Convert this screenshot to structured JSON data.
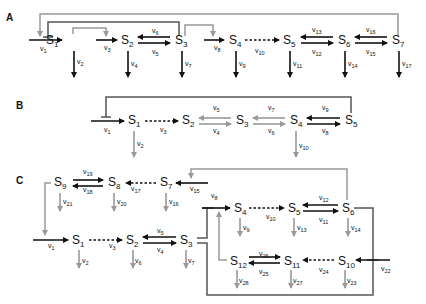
{
  "colors": {
    "black": "#111111",
    "gray": "#999999",
    "dark": "#555555"
  },
  "panels": [
    {
      "label": "A",
      "x": 6,
      "y": 21,
      "species": [
        {
          "name": "S",
          "sub": "1",
          "x": 46,
          "y": 44
        },
        {
          "name": "S",
          "sub": "2",
          "x": 121,
          "y": 44
        },
        {
          "name": "S",
          "sub": "3",
          "x": 175,
          "y": 44
        },
        {
          "name": "S",
          "sub": "4",
          "x": 229,
          "y": 44
        },
        {
          "name": "S",
          "sub": "5",
          "x": 283,
          "y": 44
        },
        {
          "name": "S",
          "sub": "6",
          "x": 338,
          "y": 44
        },
        {
          "name": "S",
          "sub": "7",
          "x": 392,
          "y": 44
        }
      ],
      "rates": [
        {
          "name": "v",
          "sub": "1",
          "x": 40,
          "y": 51
        },
        {
          "name": "v",
          "sub": "2",
          "x": 77,
          "y": 64
        },
        {
          "name": "v",
          "sub": "3",
          "x": 104,
          "y": 50
        },
        {
          "name": "v",
          "sub": "4",
          "x": 131,
          "y": 66
        },
        {
          "name": "v",
          "sub": "5",
          "x": 152,
          "y": 54
        },
        {
          "name": "v",
          "sub": "6",
          "x": 152,
          "y": 33
        },
        {
          "name": "v",
          "sub": "7",
          "x": 185,
          "y": 66
        },
        {
          "name": "v",
          "sub": "8",
          "x": 214,
          "y": 50
        },
        {
          "name": "v",
          "sub": "9",
          "x": 239,
          "y": 66
        },
        {
          "name": "v",
          "sub": "10",
          "x": 255,
          "y": 53
        },
        {
          "name": "v",
          "sub": "11",
          "x": 293,
          "y": 66
        },
        {
          "name": "v",
          "sub": "12",
          "x": 312,
          "y": 54
        },
        {
          "name": "v",
          "sub": "13",
          "x": 312,
          "y": 32
        },
        {
          "name": "v",
          "sub": "14",
          "x": 348,
          "y": 66
        },
        {
          "name": "v",
          "sub": "15",
          "x": 366,
          "y": 54
        },
        {
          "name": "v",
          "sub": "16",
          "x": 366,
          "y": 32
        },
        {
          "name": "v",
          "sub": "17",
          "x": 402,
          "y": 66
        }
      ]
    },
    {
      "label": "B",
      "x": 16,
      "y": 109,
      "species": [
        {
          "name": "S",
          "sub": "1",
          "x": 128,
          "y": 124
        },
        {
          "name": "S",
          "sub": "2",
          "x": 182,
          "y": 124
        },
        {
          "name": "S",
          "sub": "3",
          "x": 236,
          "y": 124
        },
        {
          "name": "S",
          "sub": "4",
          "x": 290,
          "y": 124
        },
        {
          "name": "S",
          "sub": "5",
          "x": 345,
          "y": 124
        }
      ],
      "rates": [
        {
          "name": "v",
          "sub": "1",
          "x": 104,
          "y": 132
        },
        {
          "name": "v",
          "sub": "2",
          "x": 137,
          "y": 146
        },
        {
          "name": "v",
          "sub": "3",
          "x": 160,
          "y": 132
        },
        {
          "name": "v",
          "sub": "4",
          "x": 213,
          "y": 133
        },
        {
          "name": "v",
          "sub": "5",
          "x": 213,
          "y": 110
        },
        {
          "name": "v",
          "sub": "6",
          "x": 268,
          "y": 133
        },
        {
          "name": "v",
          "sub": "7",
          "x": 268,
          "y": 110
        },
        {
          "name": "v",
          "sub": "8",
          "x": 322,
          "y": 133
        },
        {
          "name": "v",
          "sub": "9",
          "x": 322,
          "y": 110
        },
        {
          "name": "v",
          "sub": "10",
          "x": 299,
          "y": 148
        }
      ]
    },
    {
      "label": "C",
      "x": 16,
      "y": 184,
      "species": [
        {
          "name": "S",
          "sub": "9",
          "x": 54,
          "y": 186
        },
        {
          "name": "S",
          "sub": "8",
          "x": 108,
          "y": 186
        },
        {
          "name": "S",
          "sub": "7",
          "x": 160,
          "y": 186
        },
        {
          "name": "S",
          "sub": "1",
          "x": 72,
          "y": 244
        },
        {
          "name": "S",
          "sub": "2",
          "x": 126,
          "y": 244
        },
        {
          "name": "S",
          "sub": "3",
          "x": 180,
          "y": 244
        },
        {
          "name": "S",
          "sub": "4",
          "x": 234,
          "y": 212
        },
        {
          "name": "S",
          "sub": "5",
          "x": 288,
          "y": 212
        },
        {
          "name": "S",
          "sub": "6",
          "x": 342,
          "y": 212
        },
        {
          "name": "S",
          "sub": "12",
          "x": 230,
          "y": 265
        },
        {
          "name": "S",
          "sub": "11",
          "x": 284,
          "y": 265
        },
        {
          "name": "S",
          "sub": "10",
          "x": 338,
          "y": 265
        }
      ],
      "rates": [
        {
          "name": "v",
          "sub": "19",
          "x": 83,
          "y": 174
        },
        {
          "name": "v",
          "sub": "18",
          "x": 83,
          "y": 192
        },
        {
          "name": "v",
          "sub": "17",
          "x": 131,
          "y": 191
        },
        {
          "name": "v",
          "sub": "15",
          "x": 190,
          "y": 191
        },
        {
          "name": "v",
          "sub": "21",
          "x": 63,
          "y": 204
        },
        {
          "name": "v",
          "sub": "20",
          "x": 117,
          "y": 204
        },
        {
          "name": "v",
          "sub": "16",
          "x": 169,
          "y": 204
        },
        {
          "name": "v",
          "sub": "1",
          "x": 48,
          "y": 248
        },
        {
          "name": "v",
          "sub": "3",
          "x": 109,
          "y": 248
        },
        {
          "name": "v",
          "sub": "4",
          "x": 157,
          "y": 252
        },
        {
          "name": "v",
          "sub": "5",
          "x": 157,
          "y": 233
        },
        {
          "name": "v",
          "sub": "2",
          "x": 82,
          "y": 263
        },
        {
          "name": "v",
          "sub": "6",
          "x": 135,
          "y": 263
        },
        {
          "name": "v",
          "sub": "7",
          "x": 188,
          "y": 263
        },
        {
          "name": "v",
          "sub": "8",
          "x": 211,
          "y": 198
        },
        {
          "name": "v",
          "sub": "9",
          "x": 243,
          "y": 230
        },
        {
          "name": "v",
          "sub": "10",
          "x": 266,
          "y": 219
        },
        {
          "name": "v",
          "sub": "11",
          "x": 319,
          "y": 222
        },
        {
          "name": "v",
          "sub": "12",
          "x": 319,
          "y": 200
        },
        {
          "name": "v",
          "sub": "13",
          "x": 297,
          "y": 230
        },
        {
          "name": "v",
          "sub": "14",
          "x": 351,
          "y": 230
        },
        {
          "name": "v",
          "sub": "22",
          "x": 381,
          "y": 271
        },
        {
          "name": "v",
          "sub": "23",
          "x": 347,
          "y": 283
        },
        {
          "name": "v",
          "sub": "24",
          "x": 319,
          "y": 272
        },
        {
          "name": "v",
          "sub": "25",
          "x": 259,
          "y": 274
        },
        {
          "name": "v",
          "sub": "26",
          "x": 259,
          "y": 256
        },
        {
          "name": "v",
          "sub": "27",
          "x": 293,
          "y": 283
        },
        {
          "name": "v",
          "sub": "28",
          "x": 239,
          "y": 283
        }
      ]
    }
  ]
}
